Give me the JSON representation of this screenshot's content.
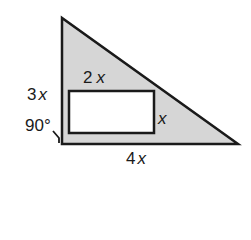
{
  "figure": {
    "type": "right-triangle-with-inscribed-rectangle",
    "triangle": {
      "fill": "#d6d6d6",
      "stroke": "#1a1a1a",
      "vertices": [
        [
          62,
          18
        ],
        [
          62,
          144
        ],
        [
          238,
          144
        ]
      ]
    },
    "rectangle": {
      "fill": "#ffffff",
      "stroke": "#1a1a1a",
      "x": 69,
      "y": 91,
      "width": 85,
      "height": 42
    },
    "labels": {
      "height": {
        "coef": "3",
        "var": "x"
      },
      "rect_width": {
        "coef": "2",
        "var": "x"
      },
      "rect_height": {
        "coef": "",
        "var": "x"
      },
      "base": {
        "coef": "4",
        "var": "x"
      },
      "angle": "90°"
    }
  }
}
